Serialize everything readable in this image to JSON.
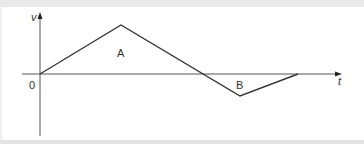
{
  "diagram": {
    "type": "velocity-time graph",
    "axes": {
      "y_label": "v",
      "x_label": "t",
      "origin_label": "0"
    },
    "regions": [
      {
        "label": "A",
        "position": "above t-axis",
        "shape": "triangle"
      },
      {
        "label": "B",
        "position": "below t-axis",
        "shape": "triangle"
      }
    ],
    "polyline_points": [
      {
        "x": 40,
        "y": 74
      },
      {
        "x": 121,
        "y": 25
      },
      {
        "x": 240,
        "y": 96
      },
      {
        "x": 298,
        "y": 74
      }
    ],
    "colors": {
      "line": "#333333",
      "axis": "#555555",
      "background": "#ffffff",
      "frame": "#e9e9e9"
    }
  }
}
